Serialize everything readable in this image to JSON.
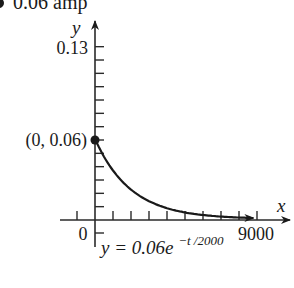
{
  "header_fragment": {
    "text": "0.06 amp"
  },
  "chart_data": {
    "type": "line",
    "title": "",
    "function": "y = 0.06e^(-t/2000)",
    "equation_label": {
      "base": "y = 0.06e",
      "exponent": "−t /2000"
    },
    "xlabel": "x",
    "ylabel": "y",
    "xlim": [
      0,
      9000
    ],
    "ylim": [
      0,
      0.13
    ],
    "x_ticks": {
      "step": 1000,
      "count_right": 9,
      "count_left": 1
    },
    "y_ticks": {
      "step": 0.01,
      "count": 13
    },
    "x_tick_labels": [
      "0",
      "9000"
    ],
    "y_tick_labels": [
      "0.13"
    ],
    "highlighted_point": {
      "x": 0,
      "y": 0.06,
      "label": "(0, 0.06)"
    },
    "x": [
      0,
      1000,
      2000,
      3000,
      4000,
      5000,
      6000,
      7000,
      8000,
      8800
    ],
    "values": [
      0.06,
      0.0364,
      0.0221,
      0.0134,
      0.0081,
      0.0049,
      0.003,
      0.0018,
      0.0011,
      0.0007
    ],
    "grid": false,
    "legend": null,
    "colors": {
      "line": "#1a1a1a",
      "axis": "#2a2a2a",
      "background": "#ffffff"
    }
  }
}
